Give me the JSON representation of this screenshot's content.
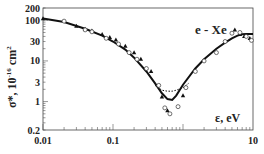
{
  "chart_data": {
    "type": "line",
    "title": "e - Xe",
    "xlabel": "ε, eV",
    "ylabel": "σ*, 10^-16 cm^2",
    "xscale": "log",
    "yscale": "log",
    "xlim": [
      0.01,
      10
    ],
    "ylim": [
      0.2,
      200
    ],
    "x_ticks": [
      "0.01",
      "0.1",
      "10"
    ],
    "y_ticks": [
      "200",
      "100",
      "30",
      "10",
      "3",
      "1",
      "0.2"
    ],
    "grid": false,
    "series": [
      {
        "name": "solid curve",
        "style": "solid",
        "x": [
          0.01,
          0.02,
          0.04,
          0.07,
          0.1,
          0.15,
          0.2,
          0.3,
          0.4,
          0.5,
          0.6,
          0.7,
          0.8,
          1.0,
          1.5,
          2,
          3,
          4,
          5,
          6,
          7,
          8,
          10
        ],
        "y": [
          110,
          90,
          62,
          42,
          30,
          19,
          12,
          5.5,
          2.8,
          1.6,
          1.15,
          1.1,
          1.4,
          2.6,
          6.5,
          11,
          20,
          28,
          36,
          42,
          45,
          46,
          46
        ]
      },
      {
        "name": "dotted curve",
        "style": "dotted",
        "x": [
          0.4,
          0.5,
          0.6,
          0.7,
          0.8,
          1.0,
          1.2
        ],
        "y": [
          2.5,
          1.9,
          1.8,
          1.8,
          1.9,
          2.2,
          2.8
        ]
      },
      {
        "name": "triangles",
        "style": "marker-triangle",
        "x": [
          0.01,
          0.03,
          0.04,
          0.05,
          0.07,
          0.09,
          0.11,
          0.15,
          0.2,
          0.25,
          0.35,
          0.5,
          0.6,
          1.0,
          5.5,
          6.5,
          7.5,
          9
        ],
        "y": [
          110,
          72,
          60,
          55,
          45,
          38,
          33,
          23,
          16,
          11,
          5.5,
          1.3,
          0.6,
          1.4,
          58,
          45,
          40,
          36
        ]
      },
      {
        "name": "open circles",
        "style": "marker-circle",
        "x": [
          0.02,
          0.04,
          0.05,
          0.08,
          0.12,
          0.17,
          0.22,
          0.3,
          0.45,
          0.55,
          0.65,
          0.85,
          1.1,
          1.5,
          2,
          3,
          4,
          5,
          6.5,
          8,
          9.5
        ],
        "y": [
          95,
          58,
          52,
          36,
          26,
          16,
          11,
          6.5,
          2.5,
          0.7,
          0.5,
          0.75,
          2.2,
          5.5,
          10,
          16,
          30,
          48,
          50,
          40,
          32
        ]
      }
    ]
  }
}
